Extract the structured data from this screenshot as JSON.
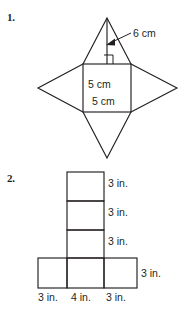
{
  "page": {
    "background_color": "#ffffff",
    "ink_color": "#231f20",
    "width": 186,
    "height": 323
  },
  "problems": [
    {
      "number": "1.",
      "figure": {
        "type": "net-of-square-pyramid",
        "base_labels": [
          "5 cm",
          "5 cm"
        ],
        "slant_height_label": "6 cm",
        "has_right_angle_mark": true,
        "geometry": {
          "square": {
            "left": 83,
            "top": 64,
            "right": 131,
            "bottom": 112
          },
          "apex_top": {
            "x": 107,
            "y": 18
          },
          "apex_bottom": {
            "x": 107,
            "y": 158
          },
          "apex_left": {
            "x": 38,
            "y": 88
          },
          "apex_right": {
            "x": 177,
            "y": 88
          },
          "altitude_line": {
            "x": 107,
            "y1": 18,
            "y2": 64
          },
          "right_angle_mark": {
            "x": 104,
            "y": 55,
            "size": 9
          },
          "arrow_tip": {
            "x": 110,
            "y": 43
          },
          "arrow_tail": {
            "x": 132,
            "y": 34
          }
        }
      }
    },
    {
      "number": "2.",
      "figure": {
        "type": "net-of-rectangular-prism",
        "right_labels": [
          "3 in.",
          "3 in.",
          "3 in.",
          "3 in."
        ],
        "bottom_labels": [
          "3 in.",
          "4 in.",
          "3 in."
        ],
        "geometry": {
          "column": {
            "left": 67,
            "right": 104,
            "top": 172,
            "bottom": 258
          },
          "column_dividers_y": [
            201,
            230
          ],
          "bottom_row": {
            "left": 38,
            "right": 137,
            "top": 258,
            "bottom": 288
          },
          "bottom_dividers_x": [
            67,
            104
          ]
        }
      }
    }
  ]
}
